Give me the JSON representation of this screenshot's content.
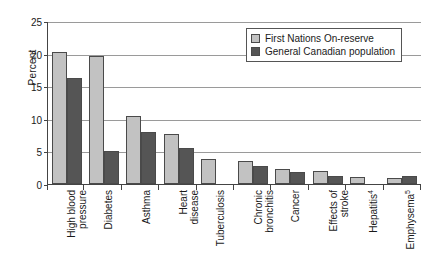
{
  "chart_data": {
    "type": "bar",
    "title": "",
    "xlabel": "",
    "ylabel": "Percent",
    "ylim": [
      0,
      25
    ],
    "yticks": [
      0,
      5,
      10,
      15,
      20,
      25
    ],
    "grid": true,
    "legend_position": "top-right",
    "categories": [
      "High blood pressure",
      "Diabetes",
      "Asthma",
      "Heart disease",
      "Tuberculosis",
      "Chronic bronchitis",
      "Cancer",
      "Effects of stroke",
      "Hepatitis",
      "Emphysema"
    ],
    "category_lines": [
      [
        "High blood",
        "pressure"
      ],
      [
        "Diabetes"
      ],
      [
        "Asthma"
      ],
      [
        "Heart",
        "disease"
      ],
      [
        "Tuberculosis"
      ],
      [
        "Chronic",
        "bronchitis"
      ],
      [
        "Cancer"
      ],
      [
        "Effects of",
        "stroke"
      ],
      [
        "Hepatitis",
        "4"
      ],
      [
        "Emphysema",
        "5"
      ]
    ],
    "category_footnotes": {
      "Hepatitis": "4",
      "Emphysema": "5"
    },
    "series": [
      {
        "name": "First Nations On-reserve",
        "color": "#c2c2c2",
        "values": [
          20.3,
          19.6,
          10.5,
          7.7,
          3.9,
          3.6,
          2.3,
          2.0,
          1.0,
          0.9
        ]
      },
      {
        "name": "General Canadian population",
        "color": "#555555",
        "values": [
          16.3,
          5.1,
          8.0,
          5.5,
          null,
          2.8,
          1.8,
          1.2,
          null,
          1.3
        ]
      }
    ]
  },
  "legend": {
    "items": [
      {
        "label": "First Nations On-reserve",
        "color": "#c2c2c2"
      },
      {
        "label": "General Canadian population",
        "color": "#555555"
      }
    ]
  },
  "axis": {
    "y_title": "Percent",
    "y_tick_labels": [
      "0",
      "5",
      "10",
      "15",
      "20",
      "25"
    ]
  }
}
